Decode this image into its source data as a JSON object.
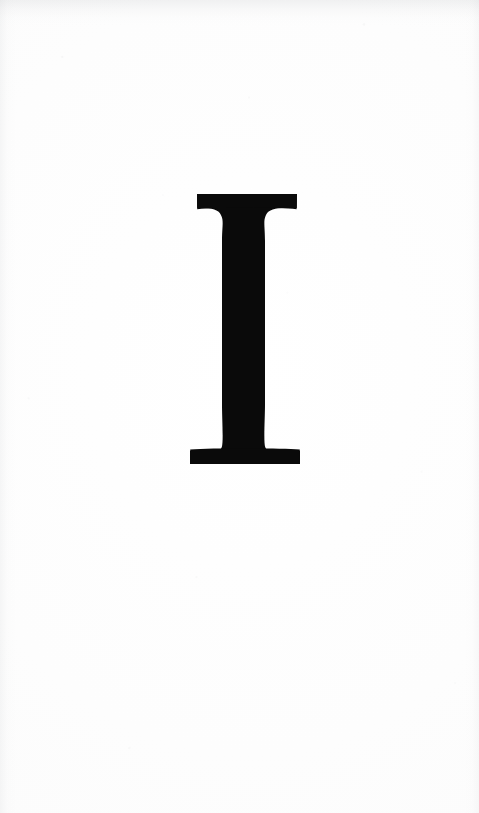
{
  "document": {
    "type": "scanned-book-page",
    "page_width": 479,
    "page_height": 813,
    "background_color": "#fdfdfd",
    "ink_color": "#0a0a0a",
    "content_description": "blank page bearing a single large serif capital letter"
  },
  "drop_cap": {
    "character": "I",
    "letter_name": "capital-letter-I",
    "typeface_style": "bracketed serif",
    "ink_color": "#0a0a0a",
    "bounds": {
      "left": 190,
      "right": 300,
      "top": 194,
      "bottom": 464,
      "width": 110,
      "height": 270,
      "center_x": 245,
      "center_y": 329
    },
    "stem": {
      "left": 222,
      "right": 265,
      "width": 43
    },
    "top_serif": {
      "left": 197,
      "right": 297,
      "thickness": 14
    },
    "bottom_serif": {
      "left": 190,
      "right": 300,
      "thickness": 13
    }
  },
  "page_marks": {
    "header_text": "",
    "footer_text": "",
    "page_number": "",
    "margin_notes": ""
  }
}
